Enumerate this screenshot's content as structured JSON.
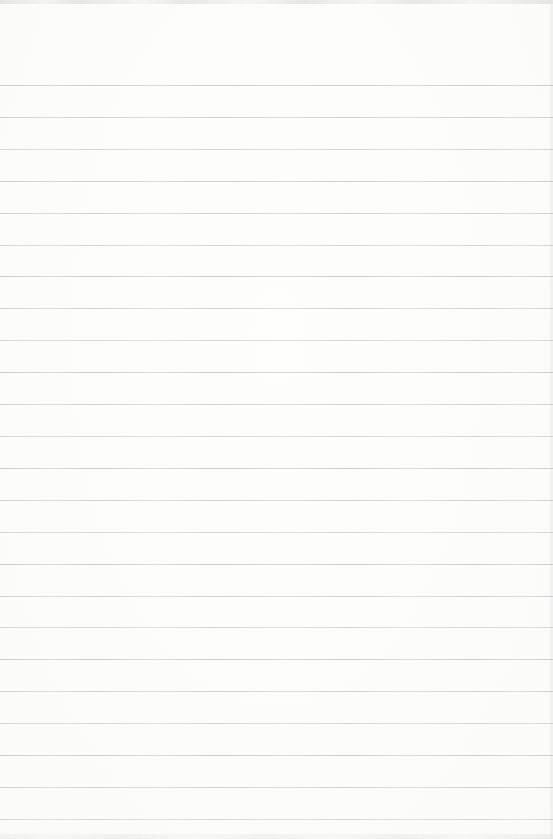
{
  "page": {
    "paper_color": "#fcfcfb",
    "ruling": {
      "line_count": 24,
      "first_line_top_px": 85,
      "spacing_px": 31.91,
      "line_color": "#bfc2c0",
      "line_opacity": 0.85
    },
    "edges": {
      "top_color": "#cfcfce",
      "bottom_color": "#dbdbda",
      "right_color": "#e8e8e7"
    }
  }
}
